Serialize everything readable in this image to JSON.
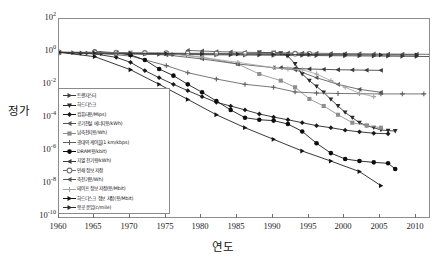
{
  "chart_data": {
    "type": "line",
    "title": "",
    "xlabel": "연도",
    "ylabel": "정가",
    "yscale": "log",
    "xlim": [
      1960,
      2012
    ],
    "ylim": [
      1e-10,
      100
    ],
    "grid": false,
    "legend_position": "center-left",
    "x_ticks": [
      "1960",
      "1965",
      "1970",
      "1975",
      "1980",
      "1985",
      "1990",
      "1995",
      "2000",
      "2005",
      "2010"
    ],
    "y_ticks": [
      "10²",
      "10⁰",
      "10⁻²",
      "10⁻⁴",
      "10⁻⁶",
      "10⁻⁸",
      "10⁻¹⁰"
    ],
    "y_tick_values": [
      100,
      1,
      0.01,
      0.0001,
      1e-06,
      1e-08,
      1e-10
    ],
    "series": [
      {
        "name": "트랜지스터",
        "marker": "right-triangle",
        "color": "#3c3c3c",
        "x": [
          1960,
          1962,
          1964,
          1966,
          1968,
          1970,
          1972,
          1974,
          1976,
          1978,
          1980,
          1982,
          1984,
          1986,
          1988,
          1990,
          1992,
          1994,
          1996,
          1998,
          2000,
          2002,
          2004,
          2006,
          2008,
          2010,
          2012
        ],
        "y": [
          1.0,
          0.95,
          0.9,
          0.85,
          0.82,
          0.8,
          0.78,
          0.76,
          0.74,
          0.73,
          0.72,
          0.71,
          0.7,
          0.69,
          0.68,
          0.67,
          0.66,
          0.65,
          0.64,
          0.63,
          0.62,
          0.61,
          0.6,
          0.59,
          0.58,
          0.57,
          0.56
        ]
      },
      {
        "name": "하드디스크",
        "marker": "down-triangle",
        "color": "#2a2a2a",
        "x": [
          1988,
          1990,
          1991,
          1992,
          1993,
          1994,
          1995,
          1996,
          1997,
          1998,
          1999,
          2000,
          2001,
          2002,
          2003,
          2004,
          2005,
          2006,
          2007
        ],
        "y": [
          1.0,
          0.95,
          0.9,
          0.6,
          0.2,
          0.05,
          0.02,
          0.009,
          0.004,
          0.0015,
          0.0006,
          0.00025,
          0.00012,
          6e-05,
          4e-05,
          3e-05,
          2.2e-05,
          2e-05,
          1.9e-05
        ]
      },
      {
        "name": "컴퓨터용/Mips)",
        "marker": "diamond",
        "color": "#1a1a1a",
        "x": [
          1960,
          1963,
          1965,
          1968,
          1970,
          1972,
          1974,
          1976,
          1978,
          1980,
          1982,
          1984,
          1986,
          1988,
          1990,
          1992,
          1994,
          1996,
          1998,
          2000,
          2002,
          2004,
          2006
        ],
        "y": [
          1.0,
          0.9,
          0.8,
          0.5,
          0.25,
          0.08,
          0.03,
          0.012,
          0.005,
          0.0022,
          0.001,
          0.0006,
          0.00035,
          0.0002,
          0.00013,
          9e-05,
          6e-05,
          4e-05,
          3e-05,
          2.15e-05,
          1.7e-05,
          1.4e-05,
          1.3e-05
        ]
      },
      {
        "name": "공기전설 에너지용/kWh)",
        "marker": "left-triangle",
        "color": "#555555",
        "x": [
          1978,
          1980,
          1982,
          1984,
          1986,
          1988,
          1990,
          1992,
          1994,
          1996,
          1998,
          2000,
          2002,
          2004,
          2006,
          2008,
          2010,
          2012
        ],
        "y": [
          1.3,
          1.2,
          1.1,
          1.05,
          1.0,
          0.98,
          0.95,
          0.92,
          0.9,
          0.88,
          0.86,
          0.84,
          0.82,
          0.8,
          0.79,
          0.78,
          0.77,
          0.76
        ]
      },
      {
        "name": "납축전지용/Wh)",
        "marker": "square",
        "color": "#8e8e8e",
        "x": [
          1960,
          1965,
          1970,
          1975,
          1980,
          1985,
          1988,
          1991,
          1993,
          1995,
          1997,
          1999,
          2001,
          2003,
          2005
        ],
        "y": [
          1.0,
          1.0,
          0.95,
          0.9,
          0.5,
          0.2,
          0.05,
          0.02,
          0.008,
          0.0016,
          0.0006,
          0.00018,
          6e-05,
          4e-05,
          3e-05
        ]
      },
      {
        "name": "광대역 케이블(1 km/kbps)",
        "marker": "plus",
        "color": "#606060",
        "x": [
          1960,
          1965,
          1970,
          1975,
          1978,
          1982,
          1986,
          1990,
          1993,
          1996,
          1999,
          2002,
          2005,
          2008,
          2011
        ],
        "y": [
          1.0,
          0.9,
          0.6,
          0.16,
          0.06,
          0.025,
          0.012,
          0.008,
          0.0042,
          0.0036,
          0.0034,
          0.0033,
          0.0032,
          0.0032,
          0.0032
        ]
      },
      {
        "name": "DRAM용/kbit)",
        "marker": "circle-filled",
        "color": "#0d0d0d",
        "x": [
          1965,
          1968,
          1970,
          1972,
          1974,
          1976,
          1978,
          1980,
          1982,
          1984,
          1986,
          1988,
          1990,
          1992,
          1994,
          1996,
          1998,
          2000,
          2002,
          2004,
          2006,
          2007
        ],
        "y": [
          1.1,
          0.95,
          0.7,
          0.35,
          0.1,
          0.04,
          0.012,
          0.004,
          0.0012,
          0.00035,
          0.00012,
          9e-05,
          8e-05,
          5e-05,
          1.8e-05,
          3.5e-06,
          9e-07,
          4e-07,
          3e-07,
          2.5e-07,
          2.2e-07,
          1e-07
        ]
      },
      {
        "name": "지열 전기용/kWh)",
        "marker": "left-triangle-small",
        "color": "#3a3a3a",
        "x": [
          1991,
          1993,
          1995,
          1997,
          1999,
          2001,
          2003,
          2005
        ],
        "y": [
          0.12,
          0.11,
          0.1,
          0.095,
          0.09,
          0.088,
          0.085,
          0.083
        ]
      },
      {
        "name": "인쇄 정보 저장",
        "marker": "circle-dot",
        "color": "#707070",
        "x": [
          1960,
          1965,
          1968,
          1972,
          1975,
          1978,
          1982,
          1986,
          1990,
          1993,
          1995
        ],
        "y": [
          1.0,
          1.0,
          0.95,
          0.93,
          0.9,
          0.88,
          0.86,
          0.85,
          0.84,
          0.83,
          0.82
        ]
      },
      {
        "name": "축전기용/Wh)",
        "marker": "left-triangle",
        "color": "#555555",
        "x": [
          1960,
          1968,
          1975,
          1980,
          1985,
          1990,
          1993,
          1996,
          1999,
          2002,
          2005
        ],
        "y": [
          1.0,
          0.9,
          0.7,
          0.4,
          0.2,
          0.12,
          0.09,
          0.03,
          0.012,
          0.006,
          0.004
        ]
      },
      {
        "name": "테이프 정보 저장(용/Mbit)",
        "marker": "plus-gray",
        "color": "#a5a5a5",
        "x": [
          1960,
          1968,
          1975,
          1980,
          1985,
          1990,
          1992,
          1994,
          1996,
          1998,
          2000,
          2002,
          2004
        ],
        "y": [
          1.0,
          0.95,
          0.9,
          0.5,
          0.25,
          0.12,
          0.1,
          0.09,
          0.05,
          0.02,
          0.008,
          0.0035,
          0.0022
        ]
      },
      {
        "name": "하드디스크 정보 저장(용/Mbit)",
        "marker": "right-triangle-dark",
        "color": "#141414",
        "x": [
          1960,
          1965,
          1970,
          1974,
          1978,
          1982,
          1986,
          1990,
          1994,
          1998,
          2002,
          2005
        ],
        "y": [
          1.0,
          0.55,
          0.09,
          0.012,
          0.0015,
          0.00018,
          3e-05,
          6e-06,
          1.2e-06,
          3e-07,
          7e-08,
          1e-08
        ]
      },
      {
        "name": "항공 운임(c/mile)",
        "marker": "right-arrow",
        "color": "#2c2c2c",
        "x": [
          1960,
          1965,
          1970,
          1975,
          1980,
          1985,
          1990,
          1995,
          2000,
          2005,
          2010
        ],
        "y": [
          1.0,
          0.92,
          0.88,
          0.84,
          0.8,
          0.78,
          0.76,
          0.74,
          0.72,
          0.7,
          0.69
        ]
      }
    ]
  },
  "axes": {
    "y_title": "정가",
    "x_title": "연도",
    "y_tick_labels": [
      {
        "base": "10",
        "exp": "2"
      },
      {
        "base": "10",
        "exp": "0"
      },
      {
        "base": "10",
        "exp": "-2"
      },
      {
        "base": "10",
        "exp": "-4"
      },
      {
        "base": "10",
        "exp": "-6"
      },
      {
        "base": "10",
        "exp": "-8"
      },
      {
        "base": "10",
        "exp": "-10"
      }
    ],
    "x_tick_labels": [
      "1960",
      "1965",
      "1970",
      "1975",
      "1980",
      "1985",
      "1990",
      "1995",
      "2000",
      "2005",
      "2010"
    ]
  },
  "legend": {
    "items": [
      {
        "label": "트랜지스터",
        "marker": "right-triangle",
        "color": "#3c3c3c"
      },
      {
        "label": "하드디스크",
        "marker": "down-triangle",
        "color": "#2a2a2a"
      },
      {
        "label": "컴퓨터용/Mips)",
        "marker": "diamond",
        "color": "#1a1a1a"
      },
      {
        "label": "공기전설 에너지용/kWh)",
        "marker": "left-triangle",
        "color": "#555555"
      },
      {
        "label": "납축전지용/Wh)",
        "marker": "square",
        "color": "#8e8e8e"
      },
      {
        "label": "광대역 케이블(1 km/kbps)",
        "marker": "plus",
        "color": "#606060"
      },
      {
        "label": "DRAM용/kbit)",
        "marker": "circle-filled",
        "color": "#0d0d0d"
      },
      {
        "label": "지열 전기용/kWh)",
        "marker": "left-triangle-small",
        "color": "#3a3a3a"
      },
      {
        "label": "인쇄 정보 저장",
        "marker": "circle-dot",
        "color": "#707070"
      },
      {
        "label": "축전기용/Wh)",
        "marker": "left-triangle",
        "color": "#555555"
      },
      {
        "label": "테이프 정보 저장(용/Mbit)",
        "marker": "plus-gray",
        "color": "#a5a5a5"
      },
      {
        "label": "하드디스크 정보 저장(용/Mbit)",
        "marker": "right-triangle-dark",
        "color": "#141414"
      },
      {
        "label": "항공 운임(c/mile)",
        "marker": "right-arrow",
        "color": "#2c2c2c"
      }
    ]
  },
  "colors": {
    "frame": "#8d8d8d",
    "background": "#ffffff",
    "text": "#1a1a1a"
  }
}
